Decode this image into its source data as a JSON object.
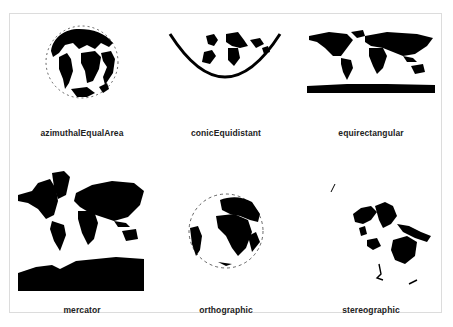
{
  "figure": {
    "panels": [
      {
        "id": "azimuthalEqualArea",
        "label": "azimuthalEqualArea"
      },
      {
        "id": "conicEquidistant",
        "label": "conicEquidistant"
      },
      {
        "id": "equirectangular",
        "label": "equirectangular"
      },
      {
        "id": "mercator",
        "label": "mercator"
      },
      {
        "id": "orthographic",
        "label": "orthographic"
      },
      {
        "id": "stereographic",
        "label": "stereographic"
      }
    ],
    "colors": {
      "land": "#000000",
      "background": "#ffffff",
      "border": "#dcdcdc",
      "label": "#222222"
    }
  }
}
